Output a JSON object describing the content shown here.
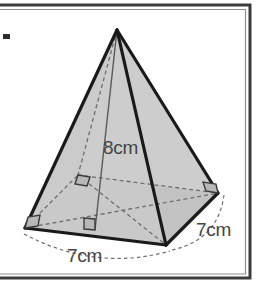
{
  "figure": {
    "name": "square-pyramid",
    "background_color": "#ffffff",
    "frame": {
      "name": "page-border",
      "style": "open-left-rectangle",
      "color": "#3c3c3c",
      "inner_color": "#7a7a7a",
      "thickness_px": 3,
      "top_y": 5,
      "bottom_y": 278,
      "right_x": 250,
      "left_open": true
    },
    "edge_mark": {
      "name": "left-edge-tick",
      "color": "#2c2c2c",
      "x": 4,
      "y": 35,
      "width": 6,
      "height": 5
    },
    "solid": {
      "fill_color": "#c9c9c9",
      "fill_color_right": "#c3c3c3",
      "edge_color": "#1a1a1a",
      "edge_width_px": 3.2,
      "hidden_edge_color": "#6e6e6e",
      "hidden_edge_width_px": 1.3,
      "hidden_edge_dash": "4,3",
      "vertices": {
        "apex": [
          117,
          30
        ],
        "base_left": [
          25,
          228
        ],
        "base_back": [
          78,
          175
        ],
        "base_right": [
          218,
          193
        ],
        "base_front": [
          166,
          245
        ]
      },
      "height_line": {
        "name": "perpendicular-height",
        "from": [
          117,
          30
        ],
        "to": [
          95,
          230
        ],
        "color": "#5a5a5a",
        "width_px": 1.4,
        "style": "solid"
      },
      "right_angle_marks": [
        {
          "name": "right-angle-base-left",
          "at": [
            25,
            228
          ],
          "size": 11
        },
        {
          "name": "right-angle-base-back",
          "at": [
            78,
            175
          ],
          "size": 11
        },
        {
          "name": "right-angle-base-right",
          "at": [
            218,
            193
          ],
          "size": 11
        },
        {
          "name": "right-angle-height-foot",
          "at": [
            95,
            230
          ],
          "size": 11
        }
      ]
    },
    "dimension_arcs": {
      "color": "#6e6e6e",
      "width_px": 1.2,
      "dash": "3.5,3",
      "front_left": {
        "name": "dimension-arc-front-left",
        "from": [
          25,
          232
        ],
        "to": [
          168,
          250
        ],
        "sag": 16
      },
      "front_right": {
        "name": "dimension-arc-front-right",
        "from": [
          170,
          249
        ],
        "to": [
          222,
          196
        ],
        "bulge": 15
      }
    },
    "labels": [
      {
        "name": "height-label",
        "text": "8cm",
        "x": 103,
        "y": 154,
        "anchor": "start",
        "color": "#454545",
        "font_size": 19
      },
      {
        "name": "base-front-left-label",
        "text": "7cm",
        "x": 67,
        "y": 260,
        "anchor": "start",
        "color": "#454545",
        "font_size": 19
      },
      {
        "name": "base-front-right-label",
        "text": "7cm",
        "x": 196,
        "y": 235,
        "anchor": "start",
        "color": "#454545",
        "font_size": 19
      }
    ]
  }
}
